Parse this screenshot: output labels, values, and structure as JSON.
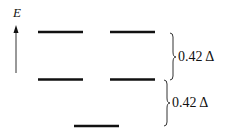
{
  "diagram": {
    "type": "energy-level-splitting",
    "axis": {
      "label": "E",
      "direction": "up"
    },
    "levels": [
      {
        "name": "upper-level-left",
        "tier": 3
      },
      {
        "name": "upper-level-right",
        "tier": 3
      },
      {
        "name": "middle-level-left",
        "tier": 2
      },
      {
        "name": "middle-level-right",
        "tier": 2
      },
      {
        "name": "lower-level",
        "tier": 1
      }
    ],
    "gaps": [
      {
        "from_tier": 2,
        "to_tier": 3,
        "label": "0.42 Δ"
      },
      {
        "from_tier": 1,
        "to_tier": 2,
        "label": "0.42 Δ"
      }
    ],
    "colors": {
      "line": "#111111",
      "background": "#ffffff"
    }
  }
}
